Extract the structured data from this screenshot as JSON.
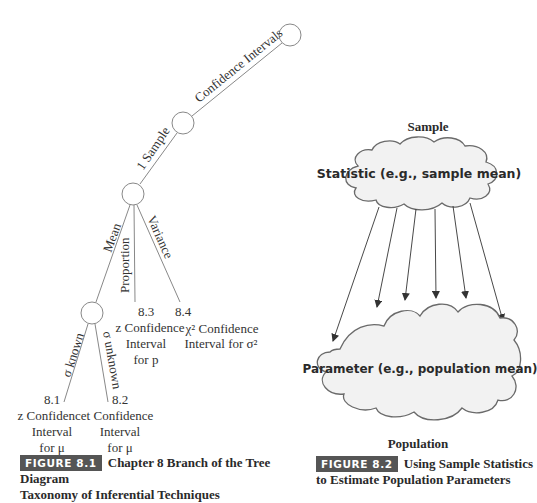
{
  "figure_8_1": {
    "badge": "FIGURE 8.1",
    "caption_line1": "Chapter 8 Branch of the Tree Diagram",
    "caption_line2": "Taxonomy of Inferential Techniques",
    "edges": {
      "confidence_intervals": "Confidence Intervals",
      "one_sample": "1 Sample",
      "mean": "Mean",
      "proportion": "Proportion",
      "variance": "Variance",
      "sigma_known": "σ known",
      "sigma_unknown": "σ unknown"
    },
    "leaves": {
      "l81": {
        "number": "8.1",
        "line1": "z Confidence",
        "line2": "Interval",
        "line3": "for μ"
      },
      "l82": {
        "number": "8.2",
        "line1": "t Confidence",
        "line2": "Interval",
        "line3": "for μ"
      },
      "l83": {
        "number": "8.3",
        "line1": "z Confidence",
        "line2": "Interval",
        "line3": "for p"
      },
      "l84": {
        "number": "8.4",
        "line1": "χ² Confidence",
        "line2": "Interval for σ²"
      }
    }
  },
  "figure_8_2": {
    "badge": "FIGURE 8.2",
    "caption_line1": "Using Sample Statistics",
    "caption_line2": "to Estimate Population Parameters",
    "sample_label": "Sample",
    "statistic_label": "Statistic (e.g., sample mean)",
    "parameter_label": "Parameter (e.g., population mean)",
    "population_label": "Population",
    "arrow_count": 6
  },
  "colors": {
    "line": "#777777",
    "badge_bg": "#555555",
    "cloud_fill": "#f2f2f2",
    "cloud_stroke": "#6a6a6a"
  }
}
